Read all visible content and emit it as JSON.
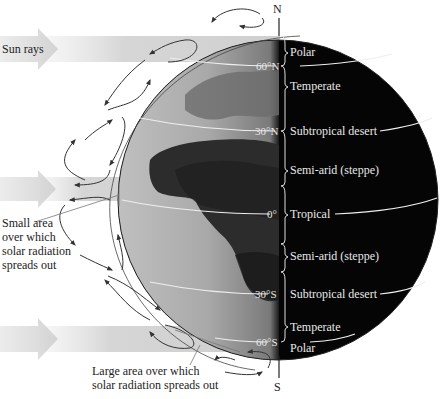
{
  "diagram": {
    "title_hint": "Sun rays striking Earth and resulting climate zones",
    "sun_rays_label": "Sun rays",
    "poles": {
      "north": "N",
      "south": "S"
    },
    "continent_label": "Africa",
    "small_area_label": "Small area over which solar radiation spreads out",
    "small_area_lines": [
      "Small area",
      "over which",
      "solar radiation",
      "spreads out"
    ],
    "large_area_label": "Large area over which solar radiation spreads out",
    "large_area_lines": [
      "Large area over which",
      "solar radiation spreads out"
    ],
    "latitudes": [
      {
        "label": "60°N",
        "y": 66
      },
      {
        "label": "30°N",
        "y": 131
      },
      {
        "label": "0°",
        "y": 214
      },
      {
        "label": "30°S",
        "y": 294
      },
      {
        "label": "60°S",
        "y": 342
      }
    ],
    "zones": [
      {
        "label": "Polar",
        "y": 52
      },
      {
        "label": "Temperate",
        "y": 86
      },
      {
        "label": "Subtropical desert",
        "y": 131
      },
      {
        "label": "Semi-arid (steppe)",
        "y": 170
      },
      {
        "label": "Tropical",
        "y": 214
      },
      {
        "label": "Semi-arid (steppe)",
        "y": 256
      },
      {
        "label": "Subtropical desert",
        "y": 294
      },
      {
        "label": "Temperate",
        "y": 327
      },
      {
        "label": "Polar",
        "y": 348
      }
    ],
    "colors": {
      "night_side": "#050505",
      "day_side_light": "#b9b9b9",
      "land_dark": "#3a3a3a",
      "ray_band": "#d9d9d9",
      "arrow": "#333333"
    }
  }
}
